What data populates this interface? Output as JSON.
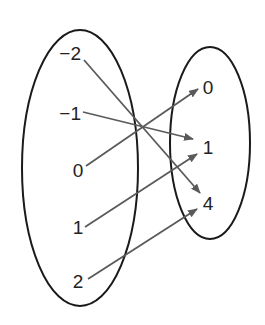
{
  "diagram": {
    "type": "mapping-diagram",
    "domain": {
      "values": [
        "−2",
        "−1",
        "0",
        "1",
        "2"
      ]
    },
    "range": {
      "values": [
        "0",
        "1",
        "4"
      ]
    },
    "mappings": [
      {
        "from": "−2",
        "to": "4"
      },
      {
        "from": "−1",
        "to": "1"
      },
      {
        "from": "0",
        "to": "0"
      },
      {
        "from": "1",
        "to": "1"
      },
      {
        "from": "2",
        "to": "4"
      }
    ],
    "colors": {
      "ellipse_stroke": "#1a1a1a",
      "arrow": "#5a5a5a",
      "text": "#222222"
    }
  }
}
